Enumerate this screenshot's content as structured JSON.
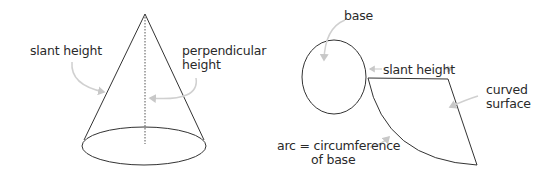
{
  "cone": {
    "labels": {
      "slant_height": "slant height",
      "perpendicular_height_line1": "perpendicular",
      "perpendicular_height_line2": "height"
    }
  },
  "net": {
    "labels": {
      "base": "base",
      "slant_height": "slant height",
      "curved_surface_line1": "curved",
      "curved_surface_line2": "surface",
      "arc_line1": "arc = circumference",
      "arc_line2": "of base"
    }
  },
  "colors": {
    "line": "#333333",
    "pointer": "#c8c8c8",
    "text": "#2a2a2a"
  }
}
